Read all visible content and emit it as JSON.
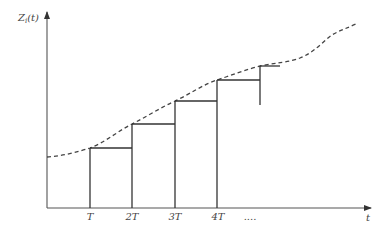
{
  "diagram": {
    "y_axis_label": "Z",
    "y_axis_label_subscript": "i",
    "y_axis_label_arg": "(t)",
    "x_axis_label": "t",
    "x_ticks": [
      {
        "label": "T",
        "x": 90
      },
      {
        "label": "2T",
        "x": 132
      },
      {
        "label": "3T",
        "x": 175
      },
      {
        "label": "4T",
        "x": 218
      }
    ],
    "x_ticks_continuation": "....",
    "curve_style": "dashed",
    "step_style": "solid",
    "colors": {
      "axis": "#555555",
      "curve": "#444444",
      "steps": "#333333",
      "labels": "#444444"
    }
  }
}
